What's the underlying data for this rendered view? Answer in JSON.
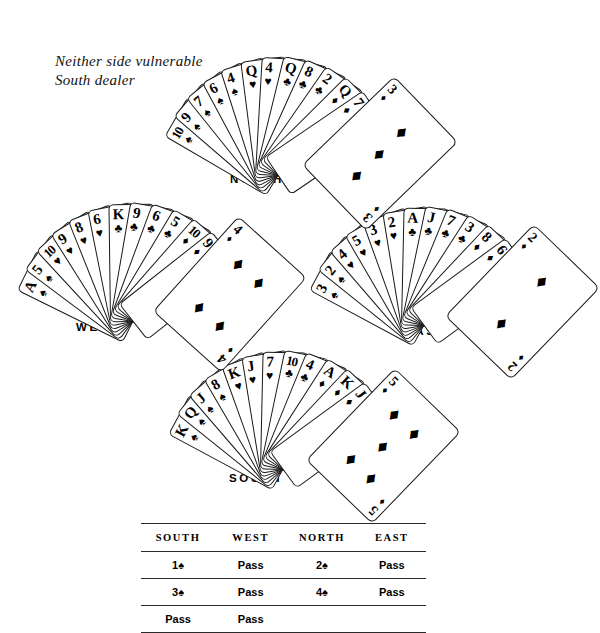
{
  "meta": {
    "vulnerability_note": "Neither side vulnerable\nSouth dealer",
    "suit_glyphs": {
      "spade": "♠",
      "heart": "♥",
      "club": "♣",
      "diamond": "♦"
    }
  },
  "positions": {
    "north_label": "NORTH",
    "west_label": "WEST",
    "east_label": "EAST",
    "south_label": "SOUTH"
  },
  "hands": {
    "north": {
      "label": "NORTH",
      "cards": [
        {
          "rank": "10",
          "suit": "spade"
        },
        {
          "rank": "9",
          "suit": "spade"
        },
        {
          "rank": "7",
          "suit": "spade"
        },
        {
          "rank": "6",
          "suit": "spade"
        },
        {
          "rank": "4",
          "suit": "spade"
        },
        {
          "rank": "Q",
          "suit": "heart"
        },
        {
          "rank": "4",
          "suit": "heart"
        },
        {
          "rank": "Q",
          "suit": "club"
        },
        {
          "rank": "8",
          "suit": "club"
        },
        {
          "rank": "2",
          "suit": "club"
        },
        {
          "rank": "Q",
          "suit": "diamond"
        },
        {
          "rank": "7",
          "suit": "diamond"
        }
      ],
      "front_card": {
        "rank": "3",
        "suit": "diamond",
        "pips": 3
      }
    },
    "west": {
      "label": "WEST",
      "cards": [
        {
          "rank": "A",
          "suit": "spade"
        },
        {
          "rank": "5",
          "suit": "spade"
        },
        {
          "rank": "10",
          "suit": "heart"
        },
        {
          "rank": "9",
          "suit": "heart"
        },
        {
          "rank": "8",
          "suit": "heart"
        },
        {
          "rank": "6",
          "suit": "heart"
        },
        {
          "rank": "K",
          "suit": "club"
        },
        {
          "rank": "9",
          "suit": "club"
        },
        {
          "rank": "6",
          "suit": "club"
        },
        {
          "rank": "5",
          "suit": "club"
        },
        {
          "rank": "10",
          "suit": "diamond"
        },
        {
          "rank": "9",
          "suit": "diamond"
        }
      ],
      "front_card": {
        "rank": "4",
        "suit": "diamond",
        "pips": 4
      }
    },
    "east": {
      "label": "EAST",
      "cards": [
        {
          "rank": "3",
          "suit": "spade"
        },
        {
          "rank": "2",
          "suit": "spade"
        },
        {
          "rank": "4",
          "suit": "heart"
        },
        {
          "rank": "5",
          "suit": "heart"
        },
        {
          "rank": "3",
          "suit": "heart"
        },
        {
          "rank": "2",
          "suit": "heart"
        },
        {
          "rank": "A",
          "suit": "club"
        },
        {
          "rank": "J",
          "suit": "club"
        },
        {
          "rank": "7",
          "suit": "club"
        },
        {
          "rank": "3",
          "suit": "club"
        },
        {
          "rank": "8",
          "suit": "diamond"
        },
        {
          "rank": "6",
          "suit": "diamond"
        }
      ],
      "front_card": {
        "rank": "2",
        "suit": "diamond",
        "pips": 2
      }
    },
    "south": {
      "label": "SOUTH",
      "cards": [
        {
          "rank": "K",
          "suit": "spade"
        },
        {
          "rank": "Q",
          "suit": "spade"
        },
        {
          "rank": "J",
          "suit": "spade"
        },
        {
          "rank": "8",
          "suit": "spade"
        },
        {
          "rank": "K",
          "suit": "heart"
        },
        {
          "rank": "J",
          "suit": "heart"
        },
        {
          "rank": "7",
          "suit": "heart"
        },
        {
          "rank": "10",
          "suit": "club"
        },
        {
          "rank": "4",
          "suit": "club"
        },
        {
          "rank": "A",
          "suit": "diamond"
        },
        {
          "rank": "K",
          "suit": "diamond"
        },
        {
          "rank": "J",
          "suit": "diamond"
        }
      ],
      "front_card": {
        "rank": "5",
        "suit": "diamond",
        "pips": 5
      }
    }
  },
  "bidding": {
    "headers": [
      "SOUTH",
      "WEST",
      "NORTH",
      "EAST"
    ],
    "rows": [
      [
        {
          "text": "1",
          "suit": "spade"
        },
        {
          "text": "Pass",
          "suit": null
        },
        {
          "text": "2",
          "suit": "spade"
        },
        {
          "text": "Pass",
          "suit": null
        }
      ],
      [
        {
          "text": "3",
          "suit": "spade"
        },
        {
          "text": "Pass",
          "suit": null
        },
        {
          "text": "4",
          "suit": "spade"
        },
        {
          "text": "Pass",
          "suit": null
        }
      ],
      [
        {
          "text": "Pass",
          "suit": null
        },
        {
          "text": "Pass",
          "suit": null
        },
        {
          "text": "",
          "suit": null
        },
        {
          "text": "",
          "suit": null
        }
      ]
    ]
  }
}
